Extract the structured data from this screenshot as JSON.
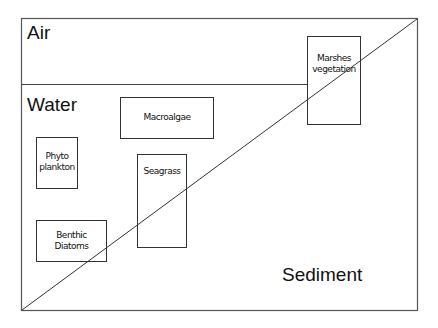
{
  "diagram": {
    "zones": {
      "air": "Air",
      "water": "Water",
      "sediment": "Sediment"
    },
    "boxes": {
      "macroalgae": "Macroalgae",
      "phytoplankton_line1": "Phyto",
      "phytoplankton_line2": "plankton",
      "seagrass": "Seagrass",
      "benthic_line1": "Benthic",
      "benthic_line2": "Diatoms",
      "marshes_line1": "Marshes",
      "marshes_line2": "vegetation"
    },
    "colors": {
      "line": "#333333",
      "text": "#111111",
      "background": "#ffffff"
    }
  }
}
